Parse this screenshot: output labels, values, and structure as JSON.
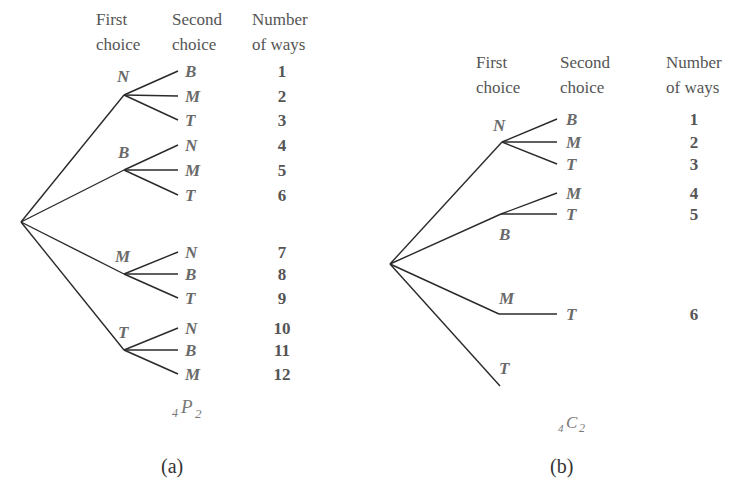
{
  "diagram_a": {
    "headers": [
      "First",
      "choice",
      "Second",
      "choice",
      "Number",
      "of ways"
    ],
    "root": [
      21,
      222
    ],
    "first": [
      {
        "label": "N",
        "node": [
          124,
          95
        ],
        "labelPos": [
          117,
          82
        ],
        "second": [
          {
            "label": "B",
            "y": 71,
            "ways": "1"
          },
          {
            "label": "M",
            "y": 96,
            "ways": "2"
          },
          {
            "label": "T",
            "y": 120,
            "ways": "3"
          }
        ]
      },
      {
        "label": "B",
        "node": [
          124,
          170
        ],
        "labelPos": [
          118,
          158
        ],
        "second": [
          {
            "label": "N",
            "y": 145,
            "ways": "4"
          },
          {
            "label": "M",
            "y": 170,
            "ways": "5"
          },
          {
            "label": "T",
            "y": 195,
            "ways": "6"
          }
        ]
      },
      {
        "label": "M",
        "node": [
          124,
          274
        ],
        "labelPos": [
          115,
          262
        ],
        "second": [
          {
            "label": "N",
            "y": 252,
            "ways": "7"
          },
          {
            "label": "B",
            "y": 274,
            "ways": "8"
          },
          {
            "label": "T",
            "y": 298,
            "ways": "9"
          }
        ]
      },
      {
        "label": "T",
        "node": [
          124,
          350
        ],
        "labelPos": [
          118,
          338
        ],
        "second": [
          {
            "label": "N",
            "y": 328,
            "ways": "10"
          },
          {
            "label": "B",
            "y": 350,
            "ways": "11"
          },
          {
            "label": "M",
            "y": 374,
            "ways": "12"
          }
        ]
      }
    ],
    "formula": {
      "pre": "4",
      "main": "P",
      "post": "2"
    },
    "caption": "(a)"
  },
  "diagram_b": {
    "headers": [
      "First",
      "choice",
      "Second",
      "choice",
      "Number",
      "of ways"
    ],
    "root": [
      390,
      264
    ],
    "first": [
      {
        "label": "N",
        "node": [
          502,
          142
        ],
        "labelPos": [
          493,
          131
        ],
        "second": [
          {
            "label": "B",
            "y": 119,
            "ways": "1"
          },
          {
            "label": "M",
            "y": 142,
            "ways": "2"
          },
          {
            "label": "T",
            "y": 164,
            "ways": "3"
          }
        ]
      },
      {
        "label": "B",
        "node": [
          501,
          214
        ],
        "labelPos": [
          499,
          240
        ],
        "second": [
          {
            "label": "M",
            "y": 193,
            "ways": "4"
          },
          {
            "label": "T",
            "y": 214,
            "ways": "5"
          }
        ]
      },
      {
        "label": "M",
        "node": [
          499,
          314
        ],
        "labelPos": [
          499,
          304
        ],
        "second": [
          {
            "label": "T",
            "y": 314,
            "ways": "6"
          }
        ]
      },
      {
        "label": "T",
        "node": [
          500,
          386
        ],
        "labelPos": [
          499,
          374
        ],
        "second": []
      }
    ],
    "formula": {
      "pre": "4",
      "main": "C",
      "post": "2"
    },
    "caption": "(b)"
  }
}
